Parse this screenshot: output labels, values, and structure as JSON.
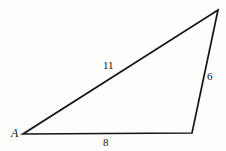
{
  "figure": {
    "kind": "triangle-diagram",
    "stroke_color": "#141414",
    "background_color": "#fdfdfc",
    "stroke_width": 1.7
  },
  "chart_data": {
    "type": "diagram",
    "title": "",
    "shape": "triangle",
    "vertices": [
      {
        "name": "A",
        "label": "A",
        "x": 23,
        "y": 134
      },
      {
        "name": "B",
        "label": "",
        "x": 192,
        "y": 133
      },
      {
        "name": "C",
        "label": "",
        "x": 218,
        "y": 10
      }
    ],
    "sides": [
      {
        "name": "AB",
        "label": "8",
        "from": "A",
        "to": "B",
        "value": 8
      },
      {
        "name": "BC",
        "label": "6",
        "from": "B",
        "to": "C",
        "value": 6
      },
      {
        "name": "AC",
        "label": "11",
        "from": "A",
        "to": "C",
        "value": 11
      }
    ]
  },
  "labels": {
    "vertex_a": "A",
    "side_ab": "8",
    "side_bc": "6",
    "side_ac": "11"
  }
}
